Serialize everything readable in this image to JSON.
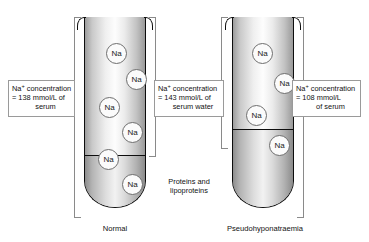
{
  "figure": {
    "title_caption_left": "Normal",
    "title_caption_right": "Pseudohyponatraemia",
    "sediment_annotation_line1": "Proteins and",
    "sediment_annotation_line2": "lipoproteins",
    "ion_label": "Na"
  },
  "callouts": {
    "left": {
      "name": "sodium-concentration-serum-normal",
      "line1_prefix": "Na",
      "line1_sup": "+",
      "line1_rest": " concentration",
      "line2": "=  138 mmol/L of",
      "line3": "serum",
      "value": 138,
      "unit": "mmol/L",
      "basis": "serum"
    },
    "middle": {
      "name": "sodium-concentration-serum-water",
      "line1_prefix": "Na",
      "line1_sup": "+",
      "line1_rest": " concentration",
      "line2": "=  143 mmol/L of",
      "line3": "serum water",
      "value": 143,
      "unit": "mmol/L",
      "basis": "serum water"
    },
    "right": {
      "name": "sodium-concentration-serum-pseudohyponatraemia",
      "line1_prefix": "Na",
      "line1_sup": "+",
      "line1_rest": " concentration",
      "line2": "=  108 mmol/L",
      "line3": "of serum",
      "value": 108,
      "unit": "mmol/L",
      "basis": "serum"
    }
  },
  "tubes": {
    "left": {
      "name": "normal-test-tube",
      "ion_count": 6,
      "ions": [
        {
          "x": 22,
          "y": 26
        },
        {
          "x": 42,
          "y": 52
        },
        {
          "x": 15,
          "y": 80
        },
        {
          "x": 38,
          "y": 105
        },
        {
          "x": 14,
          "y": 132
        },
        {
          "x": 38,
          "y": 157
        }
      ],
      "sediment_height": 52
    },
    "right": {
      "name": "pseudohyponatraemia-test-tube",
      "ion_count": 4,
      "ions": [
        {
          "x": 20,
          "y": 26
        },
        {
          "x": 42,
          "y": 56
        },
        {
          "x": 14,
          "y": 88
        },
        {
          "x": 37,
          "y": 118
        }
      ],
      "sediment_height": 78
    }
  },
  "colors": {
    "glass_outline": "#0d0d0d",
    "bracket": "#8a8a8a",
    "callout_border": "#9a9a9a",
    "ion_border": "#6e6e6e",
    "text": "#111111",
    "background": "#ffffff"
  }
}
